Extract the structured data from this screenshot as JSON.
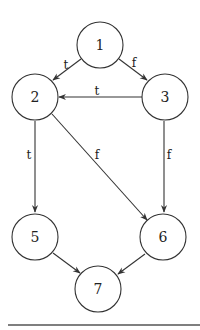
{
  "diagram": {
    "type": "control-flow-graph",
    "nodes": [
      {
        "id": "1",
        "label": "1",
        "x": 100,
        "y": 45
      },
      {
        "id": "2",
        "label": "2",
        "x": 35,
        "y": 97
      },
      {
        "id": "3",
        "label": "3",
        "x": 165,
        "y": 97
      },
      {
        "id": "5",
        "label": "5",
        "x": 35,
        "y": 237
      },
      {
        "id": "6",
        "label": "6",
        "x": 163,
        "y": 237
      },
      {
        "id": "7",
        "label": "7",
        "x": 98,
        "y": 289
      }
    ],
    "edges": [
      {
        "from": "1",
        "to": "2",
        "label": "t"
      },
      {
        "from": "1",
        "to": "3",
        "label": "f"
      },
      {
        "from": "3",
        "to": "2",
        "label": "t"
      },
      {
        "from": "2",
        "to": "5",
        "label": "t"
      },
      {
        "from": "2",
        "to": "6",
        "label": "f"
      },
      {
        "from": "3",
        "to": "6",
        "label": "f"
      },
      {
        "from": "5",
        "to": "7",
        "label": ""
      },
      {
        "from": "6",
        "to": "7",
        "label": ""
      }
    ]
  }
}
